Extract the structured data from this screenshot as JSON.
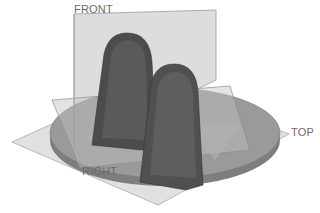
{
  "viewport": {
    "background": "#ffffff",
    "render_mode": "shaded grayscale"
  },
  "datum_planes": [
    {
      "name": "FRONT",
      "label": "FRONT",
      "color": "#c8c8c8"
    },
    {
      "name": "TOP",
      "label": "TOP",
      "color": "#d2d2d2"
    },
    {
      "name": "RIGHT",
      "label": "RIGHT",
      "color": "#bdbdbd"
    }
  ],
  "model": {
    "base": {
      "shape": "circular disk",
      "color": "#8e8e8e"
    },
    "ribs": [
      {
        "name": "rib-left",
        "color": "#4a4a4a"
      },
      {
        "name": "rib-right",
        "color": "#4f4f4f"
      }
    ]
  },
  "labels": {
    "front": "FRONT",
    "top": "TOP",
    "right": "RIGHT"
  }
}
